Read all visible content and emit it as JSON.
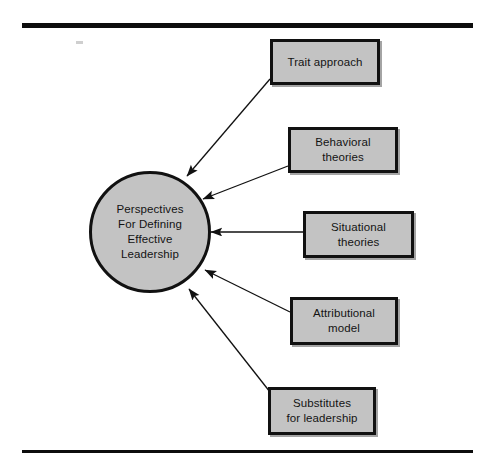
{
  "figure": {
    "background_color": "#ffffff",
    "node_fill_color": "#c3c3c3",
    "line_color": "#111111",
    "rule_color": "#0d0d0d",
    "top_rule": "top-horizontal-rule",
    "bottom_rule": "bottom-horizontal-rule"
  },
  "center": {
    "label": "Perspectives\nFor Defining\nEffective\nLeadership",
    "shape": "circle",
    "cx": 150,
    "cy": 232,
    "r": 59
  },
  "nodes": [
    {
      "id": "trait-approach",
      "label": "Trait approach",
      "x": 270,
      "y": 39,
      "w": 110,
      "h": 46
    },
    {
      "id": "behavioral-theories",
      "label": "Behavioral\ntheories",
      "x": 288,
      "y": 127,
      "w": 110,
      "h": 46
    },
    {
      "id": "situational-theories",
      "label": "Situational\ntheories",
      "x": 303,
      "y": 211,
      "w": 111,
      "h": 47
    },
    {
      "id": "attributional-model",
      "label": "Attributional\nmodel",
      "x": 290,
      "y": 297,
      "w": 108,
      "h": 48
    },
    {
      "id": "substitutes-for-leadership",
      "label": "Substitutes\nfor leadership",
      "x": 268,
      "y": 387,
      "w": 108,
      "h": 48
    }
  ],
  "arrows": [
    {
      "id": "arrow-trait-approach",
      "from": "trait-approach",
      "to": "center",
      "x1": 270,
      "y1": 79,
      "x2": 187,
      "y2": 176
    },
    {
      "id": "arrow-behavioral-theories",
      "from": "behavioral-theories",
      "to": "center",
      "x1": 288,
      "y1": 166,
      "x2": 203,
      "y2": 199
    },
    {
      "id": "arrow-situational-theories",
      "from": "situational-theories",
      "to": "center",
      "x1": 303,
      "y1": 232,
      "x2": 211,
      "y2": 232
    },
    {
      "id": "arrow-attributional-model",
      "from": "attributional-model",
      "to": "center",
      "x1": 290,
      "y1": 312,
      "x2": 205,
      "y2": 270
    },
    {
      "id": "arrow-substitutes-for-leadership",
      "from": "substitutes-for-leadership",
      "to": "center",
      "x1": 270,
      "y1": 392,
      "x2": 189,
      "y2": 289
    }
  ]
}
